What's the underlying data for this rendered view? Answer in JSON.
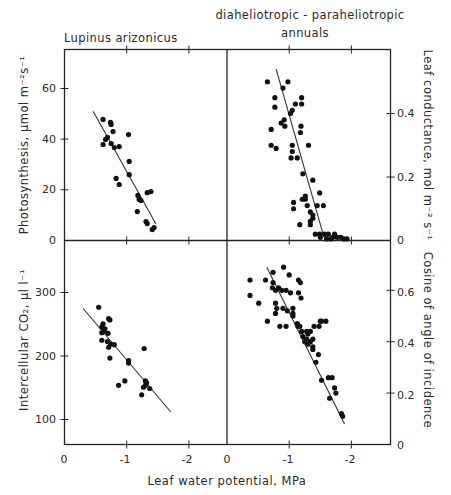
{
  "figure": {
    "titles": {
      "left": "Lupinus arizonicus",
      "right_line1": "diaheliotropic - paraheliotropic",
      "right_line2": "annuals"
    },
    "xlabel": "Leaf water potential, MPa",
    "ylabels": {
      "top_left": "Photosynthesis, μmol m⁻²s⁻¹",
      "bottom_left": "Intercellular CO₂, μl l⁻¹",
      "top_right": "Leaf conductance, mol m⁻² s⁻¹",
      "bottom_right": "Cosine of angle of incidence"
    },
    "colors": {
      "ink": "#111111",
      "background": "#ffffff"
    }
  },
  "chart_data": [
    {
      "type": "scatter",
      "panel": "top-left",
      "title": "Lupinus arizonicus",
      "xlabel": "Leaf water potential, MPa",
      "ylabel": "Photosynthesis, μmol m-2 s-1",
      "x_ticks": [
        "0",
        "-1",
        "-2"
      ],
      "y_ticks": [
        "0",
        "20",
        "40",
        "60"
      ],
      "xlim": [
        0,
        -2.6
      ],
      "ylim": [
        0,
        75
      ],
      "fit_line": [
        [
          -0.46,
          51
        ],
        [
          -1.47,
          6.5
        ]
      ],
      "points": [
        [
          -0.62,
          47.8
        ],
        [
          -0.74,
          46.6
        ],
        [
          -0.75,
          45.8
        ],
        [
          -0.78,
          43.0
        ],
        [
          -1.03,
          41.8
        ],
        [
          -0.69,
          40.7
        ],
        [
          -0.66,
          39.9
        ],
        [
          -0.62,
          37.9
        ],
        [
          -0.75,
          38.3
        ],
        [
          -0.8,
          36.7
        ],
        [
          -0.88,
          37.1
        ],
        [
          -1.04,
          31.2
        ],
        [
          -1.04,
          26.0
        ],
        [
          -0.83,
          24.5
        ],
        [
          -0.88,
          22.1
        ],
        [
          -1.18,
          17.8
        ],
        [
          -1.2,
          16.2
        ],
        [
          -1.23,
          15.8
        ],
        [
          -1.33,
          18.9
        ],
        [
          -1.39,
          19.3
        ],
        [
          -1.17,
          11.4
        ],
        [
          -1.31,
          7.5
        ],
        [
          -1.33,
          6.7
        ],
        [
          -1.41,
          4.3
        ],
        [
          -1.44,
          5.1
        ]
      ]
    },
    {
      "type": "scatter",
      "panel": "top-right",
      "title": "diaheliotropic - paraheliotropic annuals",
      "xlabel": "Leaf water potential, MPa",
      "ylabel": "Leaf conductance, mol m-2 s-1",
      "x_ticks": [
        "0",
        "-1",
        "-2"
      ],
      "y_ticks": [
        "0",
        "0.2",
        "0.4"
      ],
      "xlim": [
        0,
        -2.6
      ],
      "ylim": [
        0,
        0.6
      ],
      "fit_line": [
        [
          -0.79,
          0.54
        ],
        [
          -1.56,
          0.01
        ]
      ],
      "points": [
        [
          -0.65,
          0.5
        ],
        [
          -0.98,
          0.5
        ],
        [
          -0.9,
          0.48
        ],
        [
          -0.77,
          0.45
        ],
        [
          -0.77,
          0.42
        ],
        [
          -0.87,
          0.37
        ],
        [
          -0.92,
          0.38
        ],
        [
          -0.93,
          0.36
        ],
        [
          -1.05,
          0.41
        ],
        [
          -1.02,
          0.4
        ],
        [
          -1.1,
          0.43
        ],
        [
          -1.2,
          0.45
        ],
        [
          -1.2,
          0.43
        ],
        [
          -1.19,
          0.36
        ],
        [
          -1.18,
          0.34
        ],
        [
          -0.71,
          0.35
        ],
        [
          -0.71,
          0.3
        ],
        [
          -0.79,
          0.29
        ],
        [
          -1.05,
          0.3
        ],
        [
          -1.05,
          0.28
        ],
        [
          -1.03,
          0.26
        ],
        [
          -1.13,
          0.26
        ],
        [
          -1.31,
          0.3
        ],
        [
          -1.22,
          0.21
        ],
        [
          -1.38,
          0.19
        ],
        [
          -1.49,
          0.15
        ],
        [
          -1.26,
          0.14
        ],
        [
          -1.26,
          0.13
        ],
        [
          -1.21,
          0.13
        ],
        [
          -1.45,
          0.11
        ],
        [
          -1.55,
          0.11
        ],
        [
          -1.07,
          0.12
        ],
        [
          -1.07,
          0.1
        ],
        [
          -1.29,
          0.11
        ],
        [
          -1.34,
          0.09
        ],
        [
          -1.38,
          0.08
        ],
        [
          -1.38,
          0.07
        ],
        [
          -1.34,
          0.06
        ],
        [
          -1.34,
          0.05
        ],
        [
          -1.17,
          0.05
        ],
        [
          -1.42,
          0.02
        ],
        [
          -1.49,
          0.02
        ],
        [
          -1.5,
          0.01
        ],
        [
          -1.57,
          0.02
        ],
        [
          -1.63,
          0.02
        ],
        [
          -1.7,
          0.01
        ],
        [
          -1.73,
          0.02
        ],
        [
          -1.77,
          0.01
        ],
        [
          -1.83,
          0.01
        ],
        [
          -1.88,
          0.005
        ],
        [
          -1.93,
          0.005
        ],
        [
          -1.6,
          0.005
        ],
        [
          -1.67,
          0.005
        ]
      ]
    },
    {
      "type": "scatter",
      "panel": "bottom-left",
      "xlabel": "Leaf water potential, MPa",
      "ylabel": "Intercellular CO2, μl l-1",
      "x_ticks": [
        "0",
        "-1",
        "-2"
      ],
      "y_ticks": [
        "100",
        "200",
        "300"
      ],
      "xlim": [
        0,
        -2.6
      ],
      "ylim": [
        60,
        380
      ],
      "fit_line": [
        [
          -0.3,
          274
        ],
        [
          -1.71,
          111
        ]
      ],
      "points": [
        [
          -0.55,
          276
        ],
        [
          -0.71,
          258
        ],
        [
          -0.73,
          256
        ],
        [
          -0.62,
          250
        ],
        [
          -0.6,
          245
        ],
        [
          -0.65,
          242
        ],
        [
          -0.63,
          238
        ],
        [
          -0.6,
          236
        ],
        [
          -0.7,
          235
        ],
        [
          -0.6,
          224
        ],
        [
          -0.69,
          222
        ],
        [
          -0.74,
          218
        ],
        [
          -0.8,
          217
        ],
        [
          -0.71,
          213
        ],
        [
          -0.73,
          196
        ],
        [
          -1.03,
          192
        ],
        [
          -1.03,
          188
        ],
        [
          -0.87,
          153
        ],
        [
          -0.97,
          160
        ],
        [
          -1.28,
          211
        ],
        [
          -1.3,
          160
        ],
        [
          -1.32,
          157
        ],
        [
          -1.3,
          153
        ],
        [
          -1.27,
          150
        ],
        [
          -1.37,
          148
        ],
        [
          -1.24,
          138
        ]
      ]
    },
    {
      "type": "scatter",
      "panel": "bottom-right",
      "xlabel": "Leaf water potential, MPa",
      "ylabel": "Cosine of angle of incidence",
      "x_ticks": [
        "0",
        "-1",
        "-2"
      ],
      "y_ticks": [
        "0",
        "0.2",
        "0.4",
        "0.6"
      ],
      "xlim": [
        0,
        -2.6
      ],
      "ylim": [
        0,
        0.76
      ],
      "fit_line": [
        [
          -0.64,
          0.69
        ],
        [
          -1.89,
          0.08
        ]
      ],
      "points": [
        [
          -0.37,
          0.64
        ],
        [
          -0.37,
          0.58
        ],
        [
          -0.62,
          0.64
        ],
        [
          -0.74,
          0.63
        ],
        [
          -0.73,
          0.61
        ],
        [
          -0.83,
          0.61
        ],
        [
          -0.88,
          0.6
        ],
        [
          -0.78,
          0.6
        ],
        [
          -0.74,
          0.67
        ],
        [
          -0.91,
          0.69
        ],
        [
          -1.0,
          0.66
        ],
        [
          -0.95,
          0.6
        ],
        [
          -1.02,
          0.59
        ],
        [
          -1.15,
          0.64
        ],
        [
          -1.18,
          0.63
        ],
        [
          -1.15,
          0.59
        ],
        [
          -1.19,
          0.57
        ],
        [
          -0.51,
          0.55
        ],
        [
          -0.78,
          0.55
        ],
        [
          -0.8,
          0.53
        ],
        [
          -0.78,
          0.51
        ],
        [
          -0.9,
          0.53
        ],
        [
          -0.97,
          0.52
        ],
        [
          -1.06,
          0.53
        ],
        [
          -1.06,
          0.51
        ],
        [
          -1.06,
          0.5
        ],
        [
          -0.65,
          0.48
        ],
        [
          -0.85,
          0.46
        ],
        [
          -0.95,
          0.46
        ],
        [
          -1.13,
          0.47
        ],
        [
          -1.14,
          0.46
        ],
        [
          -1.17,
          0.46
        ],
        [
          -1.2,
          0.44
        ],
        [
          -1.28,
          0.44
        ],
        [
          -1.3,
          0.43
        ],
        [
          -1.34,
          0.44
        ],
        [
          -1.22,
          0.42
        ],
        [
          -1.28,
          0.41
        ],
        [
          -1.25,
          0.4
        ],
        [
          -1.34,
          0.4
        ],
        [
          -1.38,
          0.41
        ],
        [
          -1.3,
          0.39
        ],
        [
          -1.38,
          0.38
        ],
        [
          -1.38,
          0.37
        ],
        [
          -1.47,
          0.35
        ],
        [
          -1.4,
          0.46
        ],
        [
          -1.48,
          0.46
        ],
        [
          -1.5,
          0.48
        ],
        [
          -1.52,
          0.48
        ],
        [
          -1.59,
          0.48
        ],
        [
          -1.43,
          0.32
        ],
        [
          -1.52,
          0.25
        ],
        [
          -1.63,
          0.26
        ],
        [
          -1.73,
          0.22
        ],
        [
          -1.65,
          0.18
        ],
        [
          -1.75,
          0.2
        ],
        [
          -1.84,
          0.12
        ],
        [
          -1.69,
          0.26
        ],
        [
          -1.86,
          0.11
        ]
      ]
    }
  ]
}
